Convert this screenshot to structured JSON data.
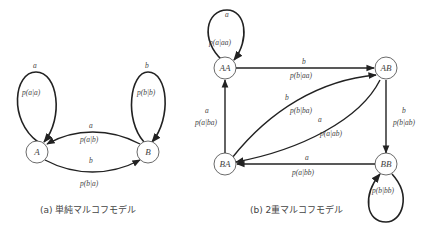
{
  "figure_a": {
    "caption": "(a) 単純マルコフモデル",
    "nodes": {
      "A": "A",
      "B": "B"
    },
    "edges": {
      "AA": {
        "symbol": "a",
        "prob": "p(a|a)"
      },
      "BB": {
        "symbol": "b",
        "prob": "p(b|b)"
      },
      "BA": {
        "symbol": "a",
        "prob": "p(a|b)"
      },
      "AB": {
        "symbol": "b",
        "prob": "p(b|a)"
      }
    }
  },
  "figure_b": {
    "caption": "(b) 2重マルコフモデル",
    "nodes": {
      "AA": "AA",
      "AB": "AB",
      "BA": "BA",
      "BB": "BB"
    },
    "edges": {
      "AA_AA": {
        "symbol": "a",
        "prob": "p(a|aa)"
      },
      "AA_AB": {
        "symbol": "b",
        "prob": "p(b|aa)"
      },
      "BA_AB": {
        "symbol": "b",
        "prob": "p(b|ba)"
      },
      "AB_BA": {
        "symbol": "a",
        "prob": "p(a|ab)"
      },
      "BA_AA": {
        "symbol": "a",
        "prob": "p(a|ba)"
      },
      "AB_BB": {
        "symbol": "b",
        "prob": "p(b|ab)"
      },
      "BB_BA": {
        "symbol": "a",
        "prob": "p(a|bb)"
      },
      "BB_BB": {
        "symbol": "",
        "prob": "p(b|bb)"
      }
    }
  },
  "colors": {
    "stroke": "#222222",
    "text": "#444444"
  }
}
